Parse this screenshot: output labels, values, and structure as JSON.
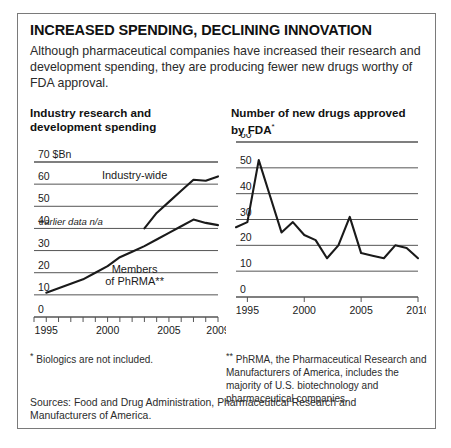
{
  "headline": "INCREASED SPENDING, DECLINING INNOVATION",
  "deck": "Although pharmaceutical companies have increased their research and development spending, they are producing fewer new drugs worthy of FDA approval.",
  "left_chart_title": "Industry research and development spending",
  "right_chart_title": "Number of new drugs approved by FDA",
  "right_chart_title_mark": "*",
  "footnote_1_mark": "*",
  "footnote_1": "Biologics are not included.",
  "footnote_2_mark": "**",
  "footnote_2": "PhRMA, the Pharmaceutical Research and Manufacturers of America, includes the majority of U.S. biotechnology and pharmaceutical companies.",
  "sources": "Sources: Food and Drug Administration, Pharmaceutical Research and Manufacturers of America.",
  "colors": {
    "line": "#1a1a1a",
    "grid": "#555555",
    "border": "#7a7a7a",
    "text": "#1a1a1a"
  },
  "chart_data": [
    {
      "type": "line",
      "id": "rd-spending",
      "title": "Industry research and development spending",
      "xlabel": "",
      "ylabel": "$Bn",
      "unit_label": "70 $Bn",
      "ylim": [
        0,
        70
      ],
      "yticks": [
        0,
        10,
        20,
        30,
        40,
        50,
        60,
        70
      ],
      "ytick_labels": [
        "0",
        "10",
        "20",
        "30",
        "40",
        "50",
        "60",
        "70 $Bn"
      ],
      "xlim": [
        1994,
        2009
      ],
      "xticks": [
        1994,
        1995,
        1996,
        1997,
        1998,
        1999,
        2000,
        2001,
        2002,
        2003,
        2004,
        2005,
        2006,
        2007,
        2008,
        2009
      ],
      "xtick_labels": [
        "1995",
        "2000",
        "2005",
        "2009"
      ],
      "xtick_label_values": [
        1995,
        2000,
        2005,
        2009
      ],
      "grid": true,
      "legend": "inline",
      "annotations": [
        {
          "text": "Industry-wide",
          "x": 2002.2,
          "y": 62.5
        },
        {
          "text": "earlier data n/a",
          "x": 1997.0,
          "y": 41.5
        },
        {
          "text": "Members",
          "x": 2002.2,
          "y": 20.0
        },
        {
          "text": "of PhRMA**",
          "x": 2002.2,
          "y": 14.5
        }
      ],
      "series": [
        {
          "name": "Industry-wide",
          "x": [
            2003,
            2004,
            2005,
            2006,
            2007,
            2008,
            2009
          ],
          "values": [
            40.0,
            47.0,
            52.0,
            57.0,
            62.0,
            61.5,
            63.5
          ]
        },
        {
          "name": "Members of PhRMA",
          "x": [
            1995,
            1996,
            1997,
            1998,
            1999,
            2000,
            2001,
            2002,
            2003,
            2004,
            2005,
            2006,
            2007,
            2008,
            2009
          ],
          "values": [
            11.0,
            13.0,
            15.0,
            17.0,
            20.0,
            23.0,
            27.0,
            29.5,
            32.0,
            35.0,
            38.0,
            41.0,
            44.0,
            42.5,
            41.5
          ]
        }
      ]
    },
    {
      "type": "line",
      "id": "fda-approvals",
      "title": "Number of new drugs approved by FDA*",
      "xlabel": "",
      "ylabel": "",
      "ylim": [
        0,
        60
      ],
      "yticks": [
        0,
        10,
        20,
        30,
        40,
        50,
        60
      ],
      "ytick_labels": [
        "0",
        "10",
        "20",
        "30",
        "40",
        "50",
        "60"
      ],
      "xlim": [
        1994,
        2010
      ],
      "xticks": [
        1995,
        2000,
        2005,
        2010
      ],
      "xtick_labels": [
        "1995",
        "2000",
        "2005",
        "2010"
      ],
      "grid": true,
      "legend": "none",
      "series": [
        {
          "name": "New drugs approved by FDA",
          "x": [
            1994,
            1995,
            1996,
            1997,
            1998,
            1999,
            2000,
            2001,
            2002,
            2003,
            2004,
            2005,
            2006,
            2007,
            2008,
            2009,
            2010
          ],
          "values": [
            27,
            29,
            53,
            39,
            25,
            29,
            24,
            22,
            15,
            20,
            31,
            17,
            16,
            15,
            20,
            19,
            15
          ]
        }
      ]
    }
  ]
}
